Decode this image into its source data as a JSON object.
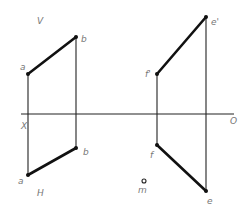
{
  "diagram": {
    "type": "orthographic projection",
    "plane_labels": {
      "vertical": "V",
      "horizontal": "H"
    },
    "axis_labels": {
      "left": "X",
      "right": "O"
    },
    "segments": [
      {
        "name": "AB",
        "front_view": [
          "a'",
          "b'"
        ],
        "top_view": [
          "a",
          "b"
        ]
      },
      {
        "name": "EF",
        "front_view": [
          "f'",
          "e'"
        ],
        "top_view": [
          "f",
          "e"
        ]
      }
    ],
    "points": {
      "a_prime": "a",
      "b_prime": "b",
      "a": "a",
      "b": "b",
      "f_prime": "f'",
      "e_prime": "e'",
      "f": "f",
      "e": "e",
      "m": "m"
    }
  }
}
